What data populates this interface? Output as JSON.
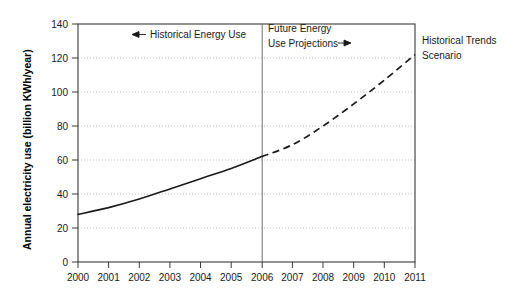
{
  "chart_data": {
    "type": "line",
    "title": "",
    "xlabel": "",
    "ylabel": "Annual electricity use (billion KWh/year)",
    "xlim": [
      2000,
      2011
    ],
    "ylim": [
      0,
      140
    ],
    "grid": true,
    "legend_position": "none",
    "x": [
      2000,
      2001,
      2002,
      2003,
      2004,
      2005,
      2006,
      2007,
      2008,
      2009,
      2010,
      2011
    ],
    "x_tick_labels": [
      "2000",
      "2001",
      "2002",
      "2003",
      "2004",
      "2005",
      "2006",
      "2007",
      "2008",
      "2009",
      "2010",
      "2011"
    ],
    "y_tick_labels": [
      "0",
      "20",
      "40",
      "60",
      "80",
      "100",
      "120",
      "140"
    ],
    "y_ticks": [
      0,
      20,
      40,
      60,
      80,
      100,
      120,
      140
    ],
    "series": [
      {
        "name": "Historical Energy Use",
        "style": "solid",
        "x": [
          2000,
          2001,
          2002,
          2003,
          2004,
          2005,
          2006
        ],
        "values": [
          28,
          32,
          37,
          43,
          49,
          55,
          62
        ]
      },
      {
        "name": "Future Energy Use Projections",
        "style": "dashed",
        "x": [
          2006,
          2007,
          2008,
          2009,
          2010,
          2011
        ],
        "values": [
          62,
          69,
          80,
          93,
          107,
          122
        ]
      }
    ],
    "annotations": [
      {
        "name": "historical-energy-use",
        "text": "Historical Energy Use",
        "arrow": "left",
        "arrow_glyph": "←"
      },
      {
        "name": "future-energy-use-projections",
        "line1": "Future Energy",
        "line2": "Use Projections",
        "arrow": "right",
        "arrow_glyph": "→"
      },
      {
        "name": "historical-trends-scenario",
        "line1": "Historical Trends",
        "line2": "Scenario"
      }
    ],
    "divider": {
      "name": "projection-divider",
      "at_x": 2006
    },
    "colors": {
      "line": "#1a1a1a",
      "grid": "#b4b4b4",
      "axis": "#3a3a3a",
      "divider": "#6e6e6e",
      "background": "#ffffff",
      "text": "#1a1a1a"
    }
  },
  "y_axis": {
    "title": "Annual electricity use (billion KWh/year)",
    "ticks": [
      {
        "label": "140"
      },
      {
        "label": "120"
      },
      {
        "label": "100"
      },
      {
        "label": "80"
      },
      {
        "label": "60"
      },
      {
        "label": "40"
      },
      {
        "label": "20"
      },
      {
        "label": "0"
      }
    ]
  },
  "x_axis": {
    "ticks": [
      {
        "label": "2000"
      },
      {
        "label": "2001"
      },
      {
        "label": "2002"
      },
      {
        "label": "2003"
      },
      {
        "label": "2004"
      },
      {
        "label": "2005"
      },
      {
        "label": "2006"
      },
      {
        "label": "2007"
      },
      {
        "label": "2008"
      },
      {
        "label": "2009"
      },
      {
        "label": "2010"
      },
      {
        "label": "2011"
      }
    ]
  },
  "annotations": {
    "historical": {
      "arrow": "←",
      "text": "Historical Energy Use"
    },
    "future": {
      "line1": "Future Energy",
      "line2": "Use Projections",
      "arrow": "→"
    },
    "scenario": {
      "line1": "Historical Trends",
      "line2": "Scenario"
    }
  }
}
